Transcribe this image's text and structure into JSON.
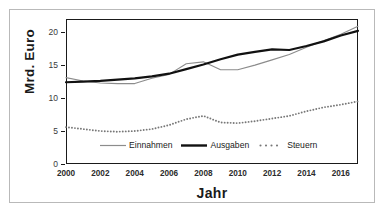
{
  "chart_data": {
    "type": "line",
    "title": "",
    "xlabel": "Jahr",
    "ylabel": "Mrd. Euro",
    "x": [
      2000,
      2001,
      2002,
      2003,
      2004,
      2005,
      2006,
      2007,
      2008,
      2009,
      2010,
      2011,
      2012,
      2013,
      2014,
      2015,
      2016,
      2017
    ],
    "xlim": [
      2000,
      2017
    ],
    "ylim": [
      0,
      22
    ],
    "xticks": [
      2000,
      2002,
      2004,
      2006,
      2008,
      2010,
      2012,
      2014,
      2016
    ],
    "xtick_labels": [
      "2000",
      "2002",
      "2004",
      "2006",
      "2008",
      "2010",
      "2012",
      "2014",
      "2016"
    ],
    "yticks": [
      0,
      5,
      10,
      15,
      20
    ],
    "ytick_labels": [
      "0",
      "5",
      "10",
      "15",
      "20"
    ],
    "grid": false,
    "legend_position": "inside-bottom-center",
    "series": [
      {
        "name": "Einnahmen",
        "style": "solid-thin",
        "color": "#8c8c8c",
        "values": [
          13.1,
          12.6,
          12.3,
          12.2,
          12.2,
          13.0,
          13.6,
          15.2,
          15.5,
          14.3,
          14.3,
          15.0,
          15.8,
          16.6,
          17.7,
          18.7,
          19.7,
          20.9
        ]
      },
      {
        "name": "Ausgaben",
        "style": "solid-thick",
        "color": "#111111",
        "values": [
          12.4,
          12.5,
          12.6,
          12.8,
          13.0,
          13.3,
          13.7,
          14.4,
          15.1,
          15.9,
          16.6,
          17.0,
          17.4,
          17.3,
          17.9,
          18.6,
          19.5,
          20.2
        ]
      },
      {
        "name": "Steuern",
        "style": "dotted",
        "color": "#777777",
        "values": [
          5.6,
          5.3,
          5.0,
          4.9,
          5.0,
          5.3,
          5.9,
          6.8,
          7.3,
          6.3,
          6.2,
          6.5,
          6.9,
          7.3,
          8.0,
          8.6,
          9.0,
          9.5
        ]
      }
    ]
  },
  "axes": {
    "y_label": "Mrd. Euro",
    "x_label": "Jahr"
  },
  "legend": {
    "items": [
      {
        "label": "Einnahmen"
      },
      {
        "label": "Ausgaben"
      },
      {
        "label": "Steuern"
      }
    ]
  }
}
